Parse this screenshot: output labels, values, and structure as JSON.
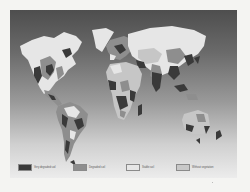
{
  "map": {
    "title": "",
    "type": "world soil degradation map"
  },
  "legend": {
    "items": [
      {
        "label": "Very degraded soil",
        "color": "#3a3a3a"
      },
      {
        "label": "Degraded soil",
        "color": "#8e8e8e"
      },
      {
        "label": "Stable soil",
        "color": "#e6e6e6"
      },
      {
        "label": "Without vegetation",
        "color": "#c8c8c8"
      }
    ]
  },
  "colors": {
    "very_degraded": "#3a3a3a",
    "degraded": "#8e8e8e",
    "stable": "#e6e6e6",
    "without_vegetation": "#c6c6c6"
  }
}
